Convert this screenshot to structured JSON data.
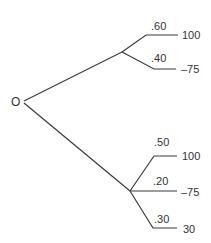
{
  "diagram": {
    "type": "decision-tree",
    "root": {
      "label": "O"
    },
    "upper_node": {
      "branches": [
        {
          "probability": ".60",
          "payoff": "100"
        },
        {
          "probability": ".40",
          "payoff": "–75"
        }
      ]
    },
    "lower_node": {
      "branches": [
        {
          "probability": ".50",
          "payoff": "100"
        },
        {
          "probability": ".20",
          "payoff": "–75"
        },
        {
          "probability": ".30",
          "payoff": "30"
        }
      ]
    }
  }
}
